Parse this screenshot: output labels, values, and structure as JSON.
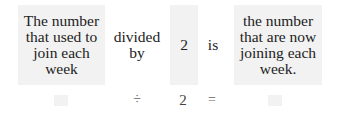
{
  "top_row": {
    "left_box": "The number that used to join each week",
    "operator_text": "divided by",
    "divisor": "2",
    "equals_text": "is",
    "right_box": "the number that are now joining each week."
  },
  "bottom_row": {
    "left_blank": "",
    "operator": "÷",
    "divisor": "2",
    "equals": "=",
    "right_blank": ""
  }
}
